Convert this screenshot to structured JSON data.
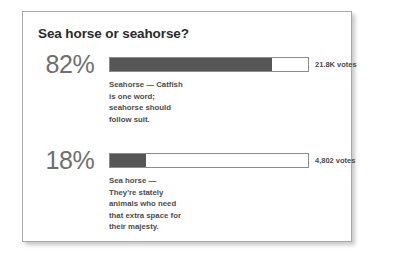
{
  "card": {
    "title": "Sea horse or seahorse?"
  },
  "chart_data": {
    "type": "bar",
    "title": "Sea horse or seahorse?",
    "orientation": "horizontal",
    "xlabel": "",
    "ylabel": "",
    "xlim": [
      0,
      100
    ],
    "grid": false,
    "legend": false,
    "categories": [
      "Seahorse",
      "Sea horse"
    ],
    "values": [
      82,
      18
    ],
    "value_labels": [
      "82%",
      "18%"
    ],
    "vote_labels": [
      "21.8K votes",
      "4,802 votes"
    ],
    "votes": [
      21800,
      4802
    ],
    "colors": {
      "bar_fill": "#565656",
      "bar_track": "#ffffff",
      "bar_border": "#8c8c8c",
      "percent_text": "#6f6f6f",
      "body_text": "#4c4c4c",
      "title_text": "#2b2b2b",
      "card_border": "#a8a8a8",
      "background": "#ffffff"
    }
  },
  "options": [
    {
      "percent": "82%",
      "fill_width": "82%",
      "votes": "21.8K votes",
      "desc_lines": [
        "Seahorse — Catfish",
        "is one word;",
        "seahorse should",
        "follow suit."
      ]
    },
    {
      "percent": "18%",
      "fill_width": "18%",
      "votes": "4,802 votes",
      "desc_lines": [
        "Sea horse —",
        "They're stately",
        "animals who need",
        "that extra space for",
        "their majesty."
      ]
    }
  ]
}
